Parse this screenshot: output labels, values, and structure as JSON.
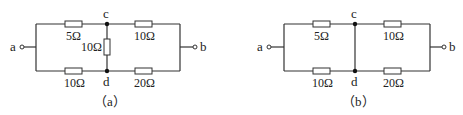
{
  "figures": [
    {
      "id": "a",
      "caption": "（a）",
      "terminals": {
        "left": "a",
        "right": "b"
      },
      "nodes": {
        "top": "c",
        "bottom": "d"
      },
      "resistors": {
        "top_left": "5Ω",
        "top_right": "10Ω",
        "middle": "10Ω",
        "bottom_left": "10Ω",
        "bottom_right": "20Ω"
      }
    },
    {
      "id": "b",
      "caption": "（b）",
      "terminals": {
        "left": "a",
        "right": "b"
      },
      "nodes": {
        "top": "c",
        "bottom": "d"
      },
      "resistors": {
        "top_left": "5Ω",
        "top_right": "10Ω",
        "bottom_left": "10Ω",
        "bottom_right": "20Ω"
      }
    }
  ],
  "colors": {
    "line": "#333333",
    "text": "#222222",
    "node": "#111111"
  }
}
